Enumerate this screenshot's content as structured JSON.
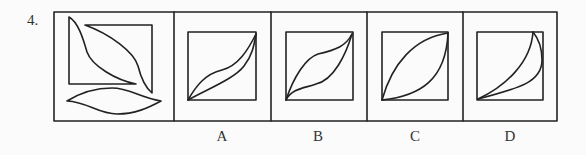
{
  "question": {
    "number": "4."
  },
  "panels": [
    {
      "id": "stem",
      "label": ""
    },
    {
      "id": "A",
      "label": "A"
    },
    {
      "id": "B",
      "label": "B"
    },
    {
      "id": "C",
      "label": "C"
    },
    {
      "id": "D",
      "label": "D"
    }
  ],
  "colors": {
    "background": "#fbfbfb",
    "stroke": "#222222"
  }
}
